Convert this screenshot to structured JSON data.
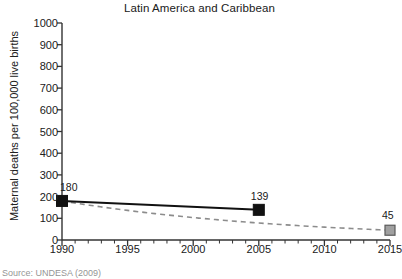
{
  "chart_data": {
    "type": "line",
    "title": "Latin America and Caribbean",
    "xlabel": "",
    "ylabel": "Maternal deaths per 100,000 live births",
    "xlim": [
      1990,
      2015
    ],
    "ylim": [
      0,
      1000
    ],
    "ytick_step": 100,
    "xtick_step": 5,
    "x_minor_tick_step": 1,
    "grid": false,
    "legend": "none",
    "yticks": [
      "0",
      "100",
      "200",
      "300",
      "400",
      "500",
      "600",
      "700",
      "800",
      "900",
      "1000"
    ],
    "xticks": [
      "1990",
      "1995",
      "2000",
      "2005",
      "2010",
      "2015"
    ],
    "series": [
      {
        "name": "observed",
        "style": "solid",
        "color": "#111111",
        "marker": "square-filled",
        "marker_color": "#111111",
        "x": [
          1990,
          2005
        ],
        "values": [
          180,
          139
        ],
        "labels": [
          "180",
          "139"
        ]
      },
      {
        "name": "target",
        "style": "dashed",
        "color": "#8c8c8c",
        "marker": "square-filled",
        "marker_color": "#a0a0a0",
        "x": [
          1990,
          2015
        ],
        "values": [
          180,
          45
        ],
        "labels": [
          "",
          "45"
        ]
      }
    ],
    "annotations": [
      {
        "text": "180",
        "x": 1990,
        "y": 180
      },
      {
        "text": "139",
        "x": 2005,
        "y": 139
      },
      {
        "text": "45",
        "x": 2015,
        "y": 45
      }
    ]
  },
  "footer": {
    "source": "Source: UNDESA (2009)"
  }
}
